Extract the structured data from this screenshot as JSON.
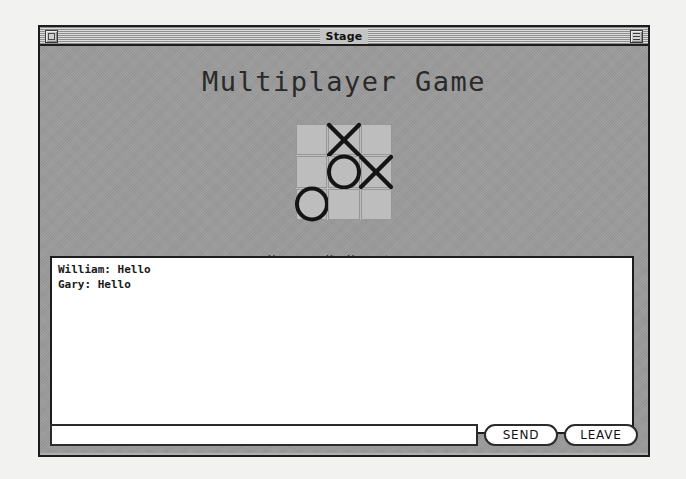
{
  "window": {
    "title": "Stage",
    "close_box": "close-box",
    "collapse_box": "collapse-box"
  },
  "main": {
    "heading": "Multiplayer Game",
    "status": "You are X. Your turn."
  },
  "board": {
    "cells": [
      {
        "id": "cell-0-0",
        "mark": ""
      },
      {
        "id": "cell-0-1",
        "mark": "X"
      },
      {
        "id": "cell-0-2",
        "mark": ""
      },
      {
        "id": "cell-1-0",
        "mark": ""
      },
      {
        "id": "cell-1-1",
        "mark": "O"
      },
      {
        "id": "cell-1-2",
        "mark": "X"
      },
      {
        "id": "cell-2-0",
        "mark": "O"
      },
      {
        "id": "cell-2-1",
        "mark": ""
      },
      {
        "id": "cell-2-2",
        "mark": ""
      }
    ]
  },
  "chat": {
    "messages": [
      "William: Hello",
      "Gary: Hello"
    ],
    "input_value": "",
    "input_placeholder": ""
  },
  "buttons": {
    "send": "SEND",
    "leave": "LEAVE"
  },
  "colors": {
    "window_bg": "#b0b0b0",
    "content_bg": "#9b9b9b",
    "board_cell": "#bdbdbd",
    "frame": "#1c1c1c",
    "text": "#1a1a1a",
    "field_bg": "#ffffff"
  }
}
